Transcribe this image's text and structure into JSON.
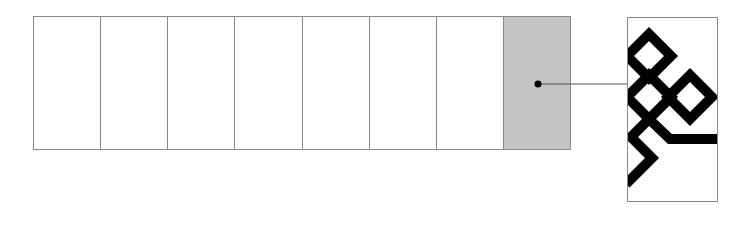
{
  "diagram": {
    "strip": {
      "cell_count": 8,
      "cells": [
        {
          "index": 1,
          "selected": false
        },
        {
          "index": 2,
          "selected": false
        },
        {
          "index": 3,
          "selected": false
        },
        {
          "index": 4,
          "selected": false
        },
        {
          "index": 5,
          "selected": false
        },
        {
          "index": 6,
          "selected": false
        },
        {
          "index": 7,
          "selected": false
        },
        {
          "index": 8,
          "selected": true
        }
      ],
      "highlight_color": "#c4c4c4",
      "border_color": "#8a8a8a"
    },
    "callout": {
      "from_cell": 8,
      "marker": "filled-dot",
      "line_color": "#555555"
    },
    "pattern_tile": {
      "description": "black geometric interlocking diamond motif with zigzag and horizontal bar",
      "fill_color": "#000000",
      "background": "#ffffff"
    }
  }
}
